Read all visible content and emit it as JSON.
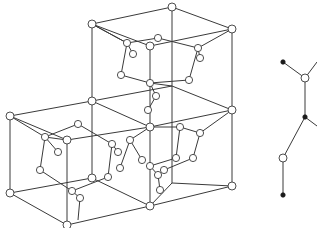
{
  "figure": {
    "colors": {
      "line": "#3a3a3a",
      "atom_fill": "#ffffff",
      "atom_dark": "#1a1a1a",
      "background": "#ffffff"
    },
    "lattice": {
      "cube_edges": [
        [
          92,
          24,
          172,
          7
        ],
        [
          172,
          7,
          232,
          29
        ],
        [
          92,
          24,
          150,
          46
        ],
        [
          150,
          46,
          232,
          29
        ],
        [
          92,
          24,
          92,
          101
        ],
        [
          172,
          7,
          172,
          86
        ],
        [
          232,
          29,
          232,
          110
        ],
        [
          150,
          46,
          150,
          127
        ],
        [
          92,
          101,
          172,
          86
        ],
        [
          172,
          86,
          232,
          110
        ],
        [
          92,
          101,
          150,
          127
        ],
        [
          150,
          127,
          232,
          110
        ],
        [
          10,
          116,
          92,
          101
        ],
        [
          10,
          116,
          67,
          140
        ],
        [
          67,
          140,
          150,
          127
        ],
        [
          10,
          116,
          10,
          193
        ],
        [
          67,
          140,
          67,
          225
        ],
        [
          10,
          193,
          67,
          225
        ],
        [
          67,
          225,
          150,
          206
        ],
        [
          10,
          193,
          92,
          178
        ],
        [
          92,
          178,
          150,
          206
        ],
        [
          92,
          101,
          92,
          178
        ],
        [
          150,
          127,
          150,
          206
        ],
        [
          150,
          206,
          232,
          186
        ],
        [
          232,
          110,
          232,
          186
        ],
        [
          150,
          206,
          172,
          183
        ],
        [
          172,
          183,
          232,
          186
        ],
        [
          172,
          86,
          172,
          183
        ]
      ],
      "corner_atoms": [
        [
          92,
          24
        ],
        [
          172,
          7
        ],
        [
          232,
          29
        ],
        [
          150,
          46
        ],
        [
          92,
          101
        ],
        [
          232,
          110
        ],
        [
          150,
          127
        ],
        [
          10,
          116
        ],
        [
          67,
          140
        ],
        [
          10,
          193
        ],
        [
          67,
          225
        ],
        [
          150,
          206
        ],
        [
          232,
          186
        ],
        [
          92,
          178
        ]
      ],
      "interior_bonds": [
        [
          92,
          24,
          127,
          43
        ],
        [
          127,
          43,
          158,
          38
        ],
        [
          158,
          38,
          198,
          48
        ],
        [
          127,
          43,
          121,
          75
        ],
        [
          198,
          48,
          189,
          80
        ],
        [
          121,
          75,
          150,
          83
        ],
        [
          189,
          80,
          150,
          83
        ],
        [
          127,
          43,
          133,
          54
        ],
        [
          198,
          48,
          200,
          58
        ],
        [
          232,
          29,
          198,
          48
        ],
        [
          92,
          24,
          127,
          43
        ],
        [
          150,
          83,
          156,
          96
        ],
        [
          156,
          96,
          148,
          110
        ],
        [
          150,
          83,
          172,
          86
        ],
        [
          10,
          116,
          45,
          137
        ],
        [
          45,
          137,
          78,
          124
        ],
        [
          78,
          124,
          112,
          144
        ],
        [
          45,
          137,
          40,
          170
        ],
        [
          112,
          144,
          108,
          177
        ],
        [
          40,
          170,
          72,
          191
        ],
        [
          108,
          177,
          72,
          191
        ],
        [
          45,
          137,
          58,
          152
        ],
        [
          112,
          144,
          118,
          152
        ],
        [
          67,
          140,
          45,
          137
        ],
        [
          72,
          191,
          80,
          198
        ],
        [
          80,
          198,
          78,
          220
        ],
        [
          150,
          127,
          180,
          127
        ],
        [
          180,
          127,
          200,
          133
        ],
        [
          180,
          127,
          176,
          158
        ],
        [
          200,
          133,
          193,
          158
        ],
        [
          176,
          158,
          150,
          166
        ],
        [
          193,
          158,
          164,
          170
        ],
        [
          150,
          166,
          158,
          175
        ],
        [
          158,
          175,
          160,
          190
        ],
        [
          232,
          110,
          200,
          133
        ],
        [
          150,
          127,
          130,
          140
        ],
        [
          130,
          140,
          120,
          168
        ],
        [
          130,
          140,
          142,
          160
        ]
      ],
      "interior_atoms": [
        [
          127,
          43
        ],
        [
          158,
          38
        ],
        [
          198,
          48
        ],
        [
          133,
          54
        ],
        [
          121,
          75
        ],
        [
          189,
          80
        ],
        [
          200,
          58
        ],
        [
          150,
          83
        ],
        [
          156,
          96
        ],
        [
          148,
          110
        ],
        [
          45,
          137
        ],
        [
          78,
          124
        ],
        [
          112,
          144
        ],
        [
          58,
          152
        ],
        [
          118,
          152
        ],
        [
          40,
          170
        ],
        [
          108,
          177
        ],
        [
          72,
          191
        ],
        [
          80,
          198
        ],
        [
          180,
          127
        ],
        [
          200,
          133
        ],
        [
          176,
          158
        ],
        [
          193,
          158
        ],
        [
          150,
          166
        ],
        [
          158,
          175
        ],
        [
          164,
          170
        ],
        [
          160,
          190
        ],
        [
          130,
          140
        ],
        [
          120,
          168
        ],
        [
          142,
          160
        ]
      ]
    },
    "chain_fragment": {
      "bonds": [
        [
          283,
          62,
          305,
          78
        ],
        [
          305,
          78,
          317,
          62
        ],
        [
          305,
          78,
          305,
          117
        ],
        [
          305,
          117,
          317,
          126
        ],
        [
          305,
          117,
          283,
          158
        ],
        [
          283,
          158,
          283,
          195
        ]
      ],
      "atoms_open": [
        [
          305,
          78
        ],
        [
          283,
          158
        ]
      ],
      "atoms_filled": [
        [
          283,
          62
        ],
        [
          305,
          117
        ],
        [
          283,
          195
        ]
      ]
    }
  }
}
